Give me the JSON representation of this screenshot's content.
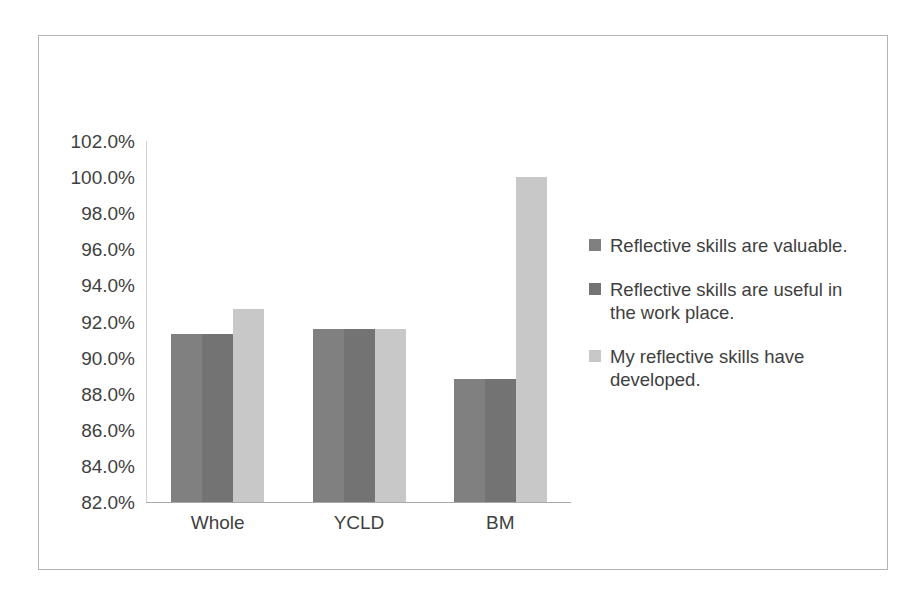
{
  "chart_data": {
    "type": "bar",
    "title": "",
    "subtitle": "",
    "xlabel": "",
    "ylabel": "",
    "categories": [
      "Whole",
      "YCLD",
      "BM"
    ],
    "series": [
      {
        "name": "Reflective skills are valuable.",
        "color": "#808080",
        "values": [
          91.3,
          91.6,
          88.8
        ]
      },
      {
        "name": "Reflective skills are useful in the work place.",
        "color": "#737373",
        "values": [
          91.3,
          91.6,
          88.8
        ]
      },
      {
        "name": "My reflective skills have developed.",
        "color": "#c8c8c8",
        "values": [
          92.7,
          91.6,
          100.0
        ]
      }
    ],
    "ylim": [
      82.0,
      102.0
    ],
    "ytick_step": 2.0,
    "ytick_labels": [
      "102.0%",
      "100.0%",
      "98.0%",
      "96.0%",
      "94.0%",
      "92.0%",
      "90.0%",
      "88.0%",
      "86.0%",
      "84.0%",
      "82.0%"
    ],
    "ytick_values": [
      102.0,
      100.0,
      98.0,
      96.0,
      94.0,
      92.0,
      90.0,
      88.0,
      86.0,
      84.0,
      82.0
    ],
    "value_suffix": "%",
    "grid": false,
    "legend_position": "right",
    "border_color": "#b4b4b4",
    "axis_color": "#a8a8a8",
    "background": "#ffffff"
  },
  "legend": {
    "entries": [
      {
        "label": "Reflective skills are valuable.",
        "color": "#808080"
      },
      {
        "label": "Reflective skills are useful in the work place.",
        "color": "#737373"
      },
      {
        "label": "My reflective skills have developed.",
        "color": "#c8c8c8"
      }
    ]
  }
}
